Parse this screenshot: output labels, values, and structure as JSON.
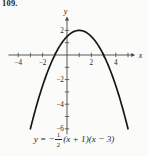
{
  "problem_number": "109.",
  "equation": {
    "prefix": "y = −",
    "numerator": "1",
    "denominator": "2",
    "factors": "(x + 1)(x − 3)",
    "full_text": "y = -(1/2)(x + 1)(x - 3)"
  },
  "colors": {
    "background": "#fbfbf9",
    "axis": "#454545",
    "curve": "#171717",
    "text": "#1e1e1e"
  },
  "chart_data": {
    "type": "line",
    "title": "",
    "equation": "y = -(1/2)(x + 1)(x - 3)",
    "function": {
      "form": "y = a(x - r1)(x - r2)",
      "a": -0.5,
      "r1": -1,
      "r2": 3
    },
    "domain_drawn": [
      -3,
      5
    ],
    "x_axis": {
      "label": "x",
      "min": -4.8,
      "max": 5.3,
      "tick_step": 1,
      "ticks": [
        -4,
        -3,
        -2,
        -1,
        1,
        2,
        3,
        4,
        5
      ],
      "labeled_ticks": [
        -4,
        -2,
        2,
        4
      ]
    },
    "y_axis": {
      "label": "y",
      "min": -6.45,
      "max": 2.85,
      "tick_step": 1,
      "ticks": [
        -6,
        -5,
        -4,
        -3,
        -2,
        -1,
        1,
        2
      ],
      "labeled_ticks": [
        2,
        -2,
        -4,
        -6
      ]
    },
    "key_points": {
      "vertex": [
        1,
        2
      ],
      "x_intercepts": [
        -1,
        3
      ],
      "y_intercept": [
        0,
        1.5
      ]
    },
    "samples": [
      [
        -3,
        -6
      ],
      [
        -2,
        -2.5
      ],
      [
        -1,
        0
      ],
      [
        0,
        1.5
      ],
      [
        1,
        2
      ],
      [
        2,
        1.5
      ],
      [
        3,
        0
      ],
      [
        4,
        -2.5
      ],
      [
        5,
        -6
      ]
    ],
    "grid": false,
    "legend": false
  }
}
